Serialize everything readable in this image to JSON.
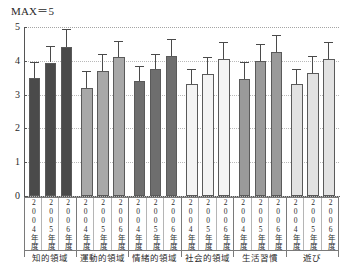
{
  "chart_data": {
    "type": "bar",
    "title": "MAX＝5",
    "xlabel": "",
    "ylabel": "",
    "ylim": [
      0,
      5
    ],
    "yticks": [
      0,
      1,
      2,
      3,
      4,
      5
    ],
    "grid": true,
    "legend": "none",
    "error_bars": "upper",
    "categories": [
      "知的領域",
      "運動的領域",
      "情緒的領域",
      "社会的領域",
      "生活習慣",
      "遊び"
    ],
    "subcategories": [
      "2004年度",
      "2005年度",
      "2006年度"
    ],
    "series": [
      {
        "name": "2004年度",
        "values": [
          3.5,
          3.2,
          3.4,
          3.3,
          3.45,
          3.3
        ]
      },
      {
        "name": "2005年度",
        "values": [
          3.95,
          3.7,
          3.75,
          3.6,
          4.0,
          3.65
        ]
      },
      {
        "name": "2006年度",
        "values": [
          4.4,
          4.1,
          4.15,
          4.05,
          4.25,
          4.05
        ]
      }
    ],
    "errors": [
      {
        "name": "2004年度",
        "values": [
          0.45,
          0.5,
          0.45,
          0.45,
          0.5,
          0.45
        ]
      },
      {
        "name": "2005年度",
        "values": [
          0.5,
          0.5,
          0.45,
          0.5,
          0.5,
          0.5
        ]
      },
      {
        "name": "2006年度",
        "values": [
          0.55,
          0.5,
          0.5,
          0.5,
          0.5,
          0.5
        ]
      }
    ],
    "group_colors": [
      "#4a4a4a",
      "#a8a8a8",
      "#6e6e6e",
      "#f4f4f4",
      "#9a9a9a",
      "#e2e2e2"
    ]
  },
  "axis": {
    "y_labels": [
      "5",
      "4",
      "3",
      "2",
      "1",
      "0"
    ]
  },
  "xaxis": {
    "groups": [
      {
        "label": "知的領域",
        "cells": [
          "2004年度",
          "2005年度",
          "2006年度"
        ]
      },
      {
        "label": "運動的領域",
        "cells": [
          "2004年度",
          "2005年度",
          "2006年度"
        ]
      },
      {
        "label": "情緒的領域",
        "cells": [
          "2004年度",
          "2005年度",
          "2006年度"
        ]
      },
      {
        "label": "社会的領域",
        "cells": [
          "2004年度",
          "2005年度",
          "2006年度"
        ]
      },
      {
        "label": "生活習慣",
        "cells": [
          "2004年度",
          "2005年度",
          "2006年度"
        ]
      },
      {
        "label": "遊び",
        "cells": [
          "2004年度",
          "2005年度",
          "2006年度"
        ]
      }
    ]
  }
}
